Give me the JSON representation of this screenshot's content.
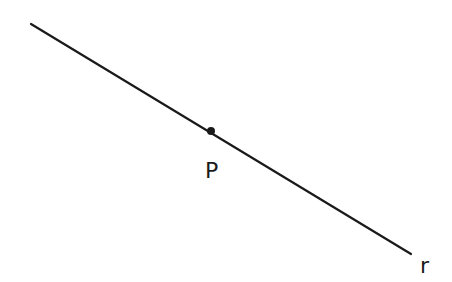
{
  "diagram": {
    "line": {
      "label": "r",
      "x1": 31,
      "y1": 24,
      "x2": 411,
      "y2": 254,
      "color": "#1a1a1a"
    },
    "point": {
      "label": "P",
      "x": 211,
      "y": 131,
      "color": "#1a1a1a"
    },
    "labels": {
      "point": "P",
      "line": "r"
    }
  }
}
